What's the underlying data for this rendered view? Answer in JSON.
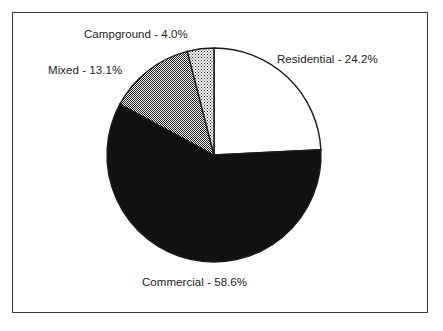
{
  "figure": {
    "name": "land-use-distribution-pie-chart",
    "border_color": "#3a3a3a",
    "background_color": "#ffffff"
  },
  "chart_data": {
    "type": "pie",
    "title": "",
    "subtitle": "",
    "xlabel": "",
    "ylabel": "",
    "legend_position": "none",
    "grid": false,
    "units": "percent",
    "start_angle_deg": 90,
    "direction": "clockwise",
    "center": {
      "x": 214,
      "y": 155
    },
    "radius": 107,
    "categories": [
      "Residential",
      "Commercial",
      "Mixed",
      "Campground"
    ],
    "values": [
      24.2,
      58.6,
      13.1,
      4.0
    ],
    "labels": [
      "Residential - 24.2%",
      "Commercial - 58.6%",
      "Mixed - 13.1%",
      "Campground - 4.0%"
    ],
    "slices": [
      {
        "name": "Residential",
        "value": 24.2,
        "label": "Residential - 24.2%",
        "fill_style": "solid-white",
        "fill_color": "#ffffff",
        "stroke_color": "#1b1b1b",
        "start_deg": 0.0,
        "end_deg": 87.12
      },
      {
        "name": "Commercial",
        "value": 58.6,
        "label": "Commercial - 58.6%",
        "fill_style": "solid-black",
        "fill_color": "#111111",
        "stroke_color": "#1b1b1b",
        "start_deg": 87.12,
        "end_deg": 298.08
      },
      {
        "name": "Mixed",
        "value": 13.1,
        "label": "Mixed - 13.1%",
        "fill_style": "checkerboard-50",
        "fill_color": "#9a9a9a",
        "stroke_color": "#1b1b1b",
        "start_deg": 298.08,
        "end_deg": 345.24
      },
      {
        "name": "Campground",
        "value": 4.0,
        "label": "Campground - 4.0%",
        "fill_style": "dots-25",
        "fill_color": "#d8d8d8",
        "stroke_color": "#1b1b1b",
        "start_deg": 345.24,
        "end_deg": 360.0
      }
    ]
  },
  "labels": {
    "campground": "Campground - 4.0%",
    "mixed": "Mixed - 13.1%",
    "residential": "Residential - 24.2%",
    "commercial": "Commercial - 58.6%"
  }
}
